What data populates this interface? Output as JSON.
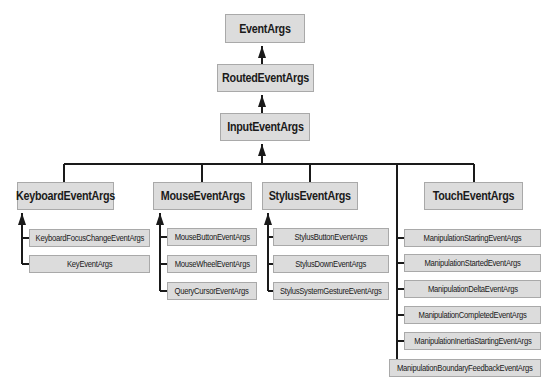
{
  "diagram": {
    "root": "EventArgs",
    "level1": "RoutedEventArgs",
    "level2": "InputEventArgs",
    "categories": [
      {
        "label": "KeyboardEventArgs",
        "children": [
          "KeyboardFocusChangeEventArgs",
          "KeyEventArgs"
        ]
      },
      {
        "label": "MouseEventArgs",
        "children": [
          "MouseButtonEventArgs",
          "MouseWheelEventArgs",
          "QueryCursorEventArgs"
        ]
      },
      {
        "label": "StylusEventArgs",
        "children": [
          "StylusButtonEventArgs",
          "StylusDownEventArgs",
          "StylusSystemGestureEventArgs"
        ]
      },
      {
        "label": "TouchEventArgs",
        "children": []
      }
    ],
    "manipulation": [
      "ManipulationStartingEventArgs",
      "ManipulationStartedEventArgs",
      "ManipulationDeltaEventArgs",
      "ManipulationCompletedEventArgs",
      "ManipulationInertiaStartingEventArgs",
      "ManipulationBoundaryFeedbackEventArgs"
    ],
    "colors": {
      "box_fill": "#dcdcdc",
      "box_border": "#a9a9a9",
      "line": "#1a1a1a"
    }
  }
}
